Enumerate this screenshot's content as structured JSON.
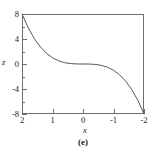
{
  "caption": "(e)",
  "colors": {
    "curve": "#555555",
    "axis": "#6e6e6e",
    "text": "#1a1a1a",
    "background": "#ffffff"
  },
  "chart_data": {
    "type": "line",
    "title": "",
    "caption": "(e)",
    "xlabel": "x",
    "ylabel": "z",
    "xlim": [
      2,
      -2
    ],
    "ylim": [
      -8,
      8
    ],
    "x_axis_reversed": true,
    "grid": false,
    "legend": null,
    "xticks": [
      2,
      1,
      0,
      -1,
      -2
    ],
    "xticklabels": [
      "2",
      "1",
      "0",
      "-1",
      "-2"
    ],
    "yticks": [
      8,
      4,
      0,
      -4,
      -8
    ],
    "yticklabels": [
      "8",
      "4",
      "0",
      "-4",
      "-8"
    ],
    "yticks_minor": [
      6,
      2,
      -2,
      -6
    ],
    "relation": "z = x^3",
    "x": [
      2,
      1.8,
      1.6,
      1.4,
      1.2,
      1.0,
      0.8,
      0.6,
      0.4,
      0.2,
      0,
      -0.2,
      -0.4,
      -0.6,
      -0.8,
      -1.0,
      -1.2,
      -1.4,
      -1.6,
      -1.8,
      -2
    ],
    "y": [
      8,
      5.832,
      4.096,
      2.744,
      1.728,
      1.0,
      0.512,
      0.216,
      0.064,
      0.008,
      0,
      -0.008,
      -0.064,
      -0.216,
      -0.512,
      -1.0,
      -1.728,
      -2.744,
      -4.096,
      -5.832,
      -8
    ]
  }
}
